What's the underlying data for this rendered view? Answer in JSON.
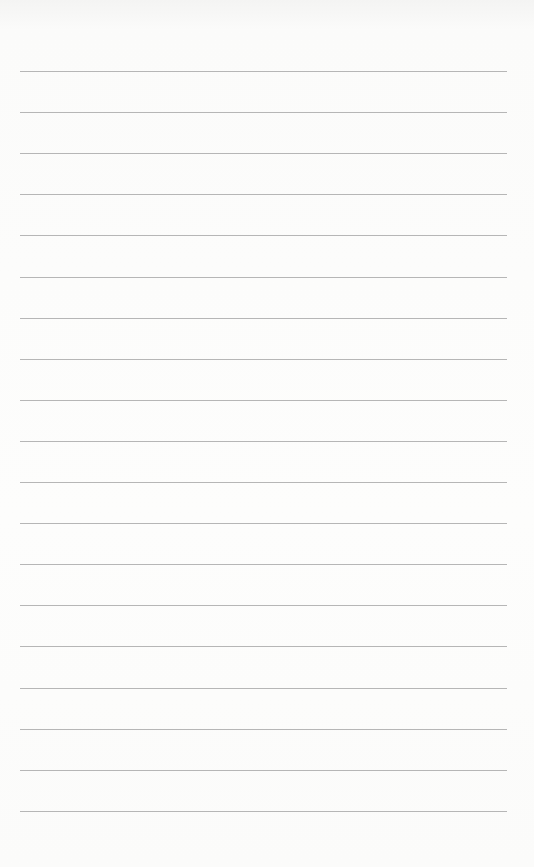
{
  "page": {
    "type": "lined-paper",
    "background_color": "#fbfbfa",
    "line_color": "#a9a9a9",
    "line_count": 19,
    "first_line_y": 71,
    "line_spacing": 41.1,
    "line_left": 20,
    "line_right": 507
  }
}
